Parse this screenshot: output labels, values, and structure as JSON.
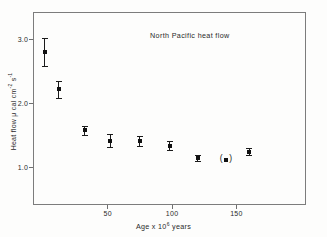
{
  "chart_data": {
    "type": "scatter",
    "title": "North Pacific heat flow",
    "xlabel_parts": {
      "pre": "Age x 10",
      "exponent": "6",
      "post": " years"
    },
    "ylabel_parts": {
      "pre": "Heat flow  μ cal cm",
      "exp1": "-2",
      "mid": " s",
      "exp2": "-1"
    },
    "xlabel": "Age x 10^6 years",
    "ylabel": "Heat flow μ cal cm^-2 s^-1",
    "xlim": [
      -8,
      204
    ],
    "ylim": [
      0.42,
      3.42
    ],
    "xticks": [
      50,
      100,
      150
    ],
    "xticklabels": [
      "50",
      "100",
      "150"
    ],
    "yticks": [
      1.0,
      2.0,
      3.0
    ],
    "yticklabels": [
      "1.0",
      "2.0",
      "3.0"
    ],
    "grid": false,
    "legend": "none",
    "marker_color": "#111111",
    "axis_color": "#7c7c7c",
    "series": [
      {
        "name": "North Pacific heat flow",
        "x": [
          1,
          12,
          32,
          52,
          75,
          98,
          120,
          142,
          160
        ],
        "y": [
          2.8,
          2.22,
          1.58,
          1.42,
          1.41,
          1.34,
          1.15,
          1.12,
          1.25
        ],
        "yerr": [
          0.22,
          0.13,
          0.07,
          0.1,
          0.08,
          0.07,
          0.04,
          0.0,
          0.06
        ],
        "bracketed": [
          false,
          false,
          false,
          false,
          false,
          false,
          false,
          true,
          false
        ]
      }
    ]
  },
  "figure": {
    "background": "#fdfdfc"
  }
}
